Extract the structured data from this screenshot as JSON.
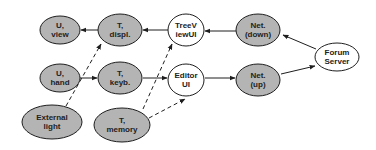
{
  "diagram": {
    "colors": {
      "shaded_fill": "#b4b4b4",
      "white_fill": "#ffffff",
      "stroke": "#1e1e1e",
      "background": "#ffffff"
    },
    "nodes": [
      {
        "id": "u_view",
        "line1": "U,",
        "line2": "view",
        "shaded": true
      },
      {
        "id": "t_displ",
        "line1": "T,",
        "line2": "displ.",
        "shaded": true
      },
      {
        "id": "treeviewui",
        "line1": "TreeV",
        "line2": "iewUI",
        "shaded": false
      },
      {
        "id": "net_down",
        "line1": "Net.",
        "line2": "(down)",
        "shaded": true
      },
      {
        "id": "forum_server",
        "line1": "Forum",
        "line2": "Server",
        "shaded": false
      },
      {
        "id": "u_hand",
        "line1": "U,",
        "line2": "hand",
        "shaded": true
      },
      {
        "id": "t_keyb",
        "line1": "T,",
        "line2": "keyb.",
        "shaded": true
      },
      {
        "id": "editor_ui",
        "line1": "Editor",
        "line2": "UI",
        "shaded": false
      },
      {
        "id": "net_up",
        "line1": "Net.",
        "line2": "(up)",
        "shaded": true
      },
      {
        "id": "external_light",
        "line1": "External",
        "line2": "light",
        "shaded": true
      },
      {
        "id": "t_memory",
        "line1": "T,",
        "line2": "memory",
        "shaded": true
      }
    ],
    "edges": [
      {
        "from": "t_displ",
        "to": "u_view",
        "style": "solid"
      },
      {
        "from": "treeviewui",
        "to": "t_displ",
        "style": "solid"
      },
      {
        "from": "net_down",
        "to": "treeviewui",
        "style": "solid"
      },
      {
        "from": "forum_server",
        "to": "net_down",
        "style": "solid"
      },
      {
        "from": "u_hand",
        "to": "t_keyb",
        "style": "solid"
      },
      {
        "from": "t_keyb",
        "to": "editor_ui",
        "style": "solid"
      },
      {
        "from": "editor_ui",
        "to": "net_up",
        "style": "solid"
      },
      {
        "from": "net_up",
        "to": "forum_server",
        "style": "solid"
      },
      {
        "from": "external_light",
        "to": "t_displ",
        "style": "dashed"
      },
      {
        "from": "t_memory",
        "to": "treeviewui",
        "style": "dashed"
      },
      {
        "from": "t_memory",
        "to": "editor_ui",
        "style": "dashed"
      }
    ]
  }
}
